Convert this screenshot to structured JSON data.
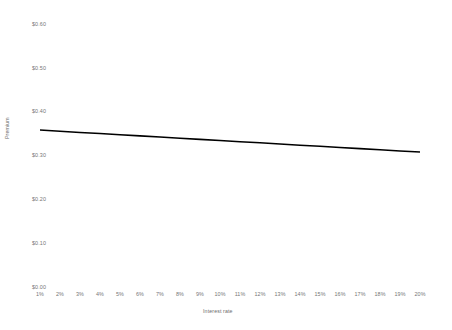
{
  "chart_data": {
    "type": "line",
    "title": "",
    "xlabel": "Interest rate",
    "ylabel": "Premium",
    "grid": false,
    "legend": false,
    "x": [
      "1%",
      "2%",
      "3%",
      "4%",
      "5%",
      "6%",
      "7%",
      "8%",
      "9%",
      "10%",
      "11%",
      "12%",
      "13%",
      "14%",
      "15%",
      "16%",
      "17%",
      "18%",
      "19%",
      "20%"
    ],
    "x_numeric": [
      1,
      2,
      3,
      4,
      5,
      6,
      7,
      8,
      9,
      10,
      11,
      12,
      13,
      14,
      15,
      16,
      17,
      18,
      19,
      20
    ],
    "xlim": [
      1,
      20
    ],
    "ylim": [
      0.0,
      0.6
    ],
    "ytick_labels": [
      "$0.60",
      "$0.50",
      "$0.40",
      "$0.30",
      "$0.20",
      "$0.10",
      "$0.00"
    ],
    "ytick_values": [
      0.6,
      0.5,
      0.4,
      0.3,
      0.2,
      0.1,
      0.0
    ],
    "series": [
      {
        "name": "Premium",
        "color": "#000000",
        "values": [
          0.358,
          0.3554,
          0.3527,
          0.3501,
          0.3474,
          0.3448,
          0.3421,
          0.3395,
          0.3368,
          0.3342,
          0.3316,
          0.3289,
          0.3263,
          0.3236,
          0.321,
          0.3183,
          0.3157,
          0.313,
          0.3104,
          0.308
        ]
      }
    ]
  }
}
